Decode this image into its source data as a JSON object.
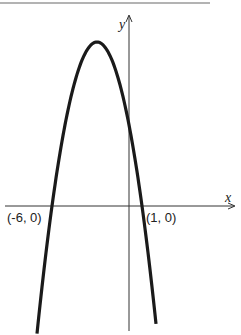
{
  "chart_data": {
    "type": "line",
    "title": "",
    "xlabel": "x",
    "ylabel": "y",
    "function": "y = a(x + 6)(x - 1), a < 0 (downward-opening parabola)",
    "series": [
      {
        "name": "parabola",
        "x": [
          -7.1,
          -6,
          -5,
          -4,
          -3,
          -2.5,
          -2,
          -1,
          0,
          1,
          2
        ],
        "y": [
          -2.1,
          0,
          1.06,
          1.6,
          1.87,
          1.91,
          1.87,
          1.6,
          1.06,
          0,
          -1.33
        ]
      }
    ],
    "annotations": [
      {
        "text": "(-6, 0)",
        "x": -6,
        "y": 0
      },
      {
        "text": "(1, 0)",
        "x": 1,
        "y": 0
      }
    ],
    "grid": false,
    "legend": null
  },
  "labels": {
    "x_axis": "x",
    "y_axis": "y",
    "left_intercept": "(-6, 0)",
    "right_intercept": "(1, 0)"
  },
  "colors": {
    "curve": "#1a1a1a",
    "axis": "#333333",
    "top_rule": "#9a9a9a"
  }
}
